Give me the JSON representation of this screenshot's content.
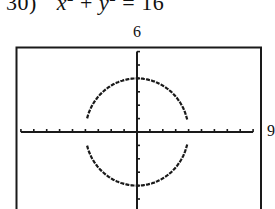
{
  "problem": {
    "number": "30)",
    "var_x": "x",
    "exp_x": "2",
    "plus": "+",
    "var_y": "y",
    "exp_y": "2",
    "equals": "=",
    "rhs": "16"
  },
  "window_labels": {
    "ymax": "6",
    "xmax": "9"
  },
  "chart_data": {
    "type": "line",
    "equation": "x^2 + y^2 = 16",
    "series": [
      {
        "name": "upper",
        "function": "y = sqrt(16 - x^2)",
        "x": [
          -4,
          -3.5,
          -3,
          -2.5,
          -2,
          -1.5,
          -1,
          -0.5,
          0,
          0.5,
          1,
          1.5,
          2,
          2.5,
          3,
          3.5,
          4
        ],
        "values": [
          0,
          1.94,
          2.65,
          3.12,
          3.46,
          3.71,
          3.87,
          3.97,
          4,
          3.97,
          3.87,
          3.71,
          3.46,
          3.12,
          2.65,
          1.94,
          0
        ]
      },
      {
        "name": "lower",
        "function": "y = -sqrt(16 - x^2)",
        "x": [
          -4,
          -3.5,
          -3,
          -2.5,
          -2,
          -1.5,
          -1,
          -0.5,
          0,
          0.5,
          1,
          1.5,
          2,
          2.5,
          3,
          3.5,
          4
        ],
        "values": [
          0,
          -1.94,
          -2.65,
          -3.12,
          -3.46,
          -3.71,
          -3.87,
          -3.97,
          -4,
          -3.97,
          -3.87,
          -3.71,
          -3.46,
          -3.12,
          -2.65,
          -1.94,
          0
        ]
      }
    ],
    "xlabel": "",
    "ylabel": "",
    "xlim": [
      -9,
      9
    ],
    "ylim": [
      -6,
      6
    ],
    "xscl": 1,
    "yscl": 1,
    "tick_labels": {
      "ymax": "6",
      "xmax": "9"
    },
    "grid": false,
    "legend": "none"
  }
}
